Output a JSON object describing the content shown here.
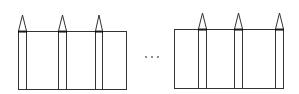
{
  "diagram": {
    "stroke_color": "#333333",
    "background": "#ffffff",
    "groups": [
      {
        "name": "left-group",
        "rect": {
          "x": 18,
          "y": 31,
          "w": 108,
          "h": 58
        },
        "pencils": [
          {
            "x": 18,
            "w": 8,
            "tip_y": 15
          },
          {
            "x": 58,
            "w": 8,
            "tip_y": 15
          },
          {
            "x": 95,
            "w": 7,
            "tip_y": 15
          }
        ]
      },
      {
        "name": "right-group",
        "rect": {
          "x": 174,
          "y": 29,
          "w": 109,
          "h": 59
        },
        "pencils": [
          {
            "x": 198,
            "w": 8,
            "tip_y": 13
          },
          {
            "x": 234,
            "w": 8,
            "tip_y": 13
          },
          {
            "x": 275,
            "w": 8,
            "tip_y": 13
          }
        ]
      }
    ],
    "ellipsis": {
      "text": "…",
      "dots": [
        {
          "x": 146,
          "y": 57
        },
        {
          "x": 152,
          "y": 57
        },
        {
          "x": 158,
          "y": 57
        }
      ]
    }
  }
}
